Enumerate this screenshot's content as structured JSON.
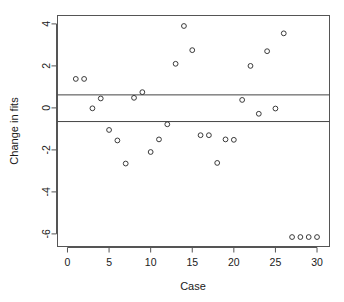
{
  "chart_data": {
    "type": "scatter",
    "title": "",
    "xlabel": "Case",
    "ylabel": "Change in fits",
    "xlim": [
      -1.2,
      31.5
    ],
    "ylim": [
      -6.6,
      4.4
    ],
    "grid": false,
    "legend": null,
    "x_ticks": [
      0,
      5,
      10,
      15,
      20,
      25,
      30
    ],
    "x_tick_labels": [
      "0",
      "5",
      "10",
      "15",
      "20",
      "25",
      "30"
    ],
    "y_ticks": [
      4,
      2,
      0,
      -2,
      -4,
      -6
    ],
    "y_tick_labels": [
      "4",
      "2",
      "0",
      "-2",
      "-4",
      "-6"
    ],
    "reference_lines": [
      {
        "name": "upper-cutoff",
        "y": 0.62
      },
      {
        "name": "lower-cutoff",
        "y": -0.65
      }
    ],
    "marker": "open-circle",
    "x": [
      1,
      2,
      3,
      4,
      5,
      6,
      7,
      8,
      9,
      10,
      11,
      12,
      13,
      14,
      15,
      16,
      17,
      18,
      19,
      20,
      21,
      22,
      23,
      24,
      25,
      26,
      27,
      28,
      29,
      30
    ],
    "y": [
      1.38,
      1.38,
      -0.02,
      0.45,
      -1.05,
      -1.55,
      -2.65,
      0.48,
      0.75,
      -2.1,
      -1.5,
      -0.78,
      2.1,
      3.9,
      2.75,
      -1.3,
      -1.3,
      -2.62,
      -1.5,
      -1.52,
      0.38,
      2.0,
      -0.28,
      2.7,
      -0.03,
      3.55,
      -6.15,
      -6.15,
      -6.15,
      -6.15
    ]
  },
  "colors": {
    "point_stroke": "#3a3a3a",
    "axis": "#555555",
    "reference_line": "#444444",
    "background": "#ffffff",
    "text": "#1a1a1a"
  }
}
